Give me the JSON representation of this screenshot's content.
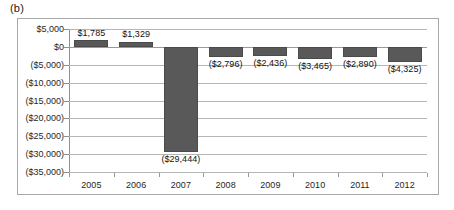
{
  "panel": {
    "label": "(b)"
  },
  "chart_data": {
    "type": "bar",
    "title": "",
    "subtitle": "",
    "xlabel": "",
    "ylabel": "",
    "categories": [
      "2005",
      "2006",
      "2007",
      "2008",
      "2009",
      "2010",
      "2011",
      "2012"
    ],
    "values": [
      1785,
      1329,
      -29444,
      -2796,
      -2436,
      -3465,
      -2890,
      -4325
    ],
    "data_labels": [
      "$1,785",
      "$1,329",
      "($29,444)",
      "($2,796)",
      "($2,436)",
      "($3,465)",
      "($2,890)",
      "($4,325)"
    ],
    "ylim": [
      -35000,
      5000
    ],
    "ytick_values": [
      5000,
      0,
      -5000,
      -10000,
      -15000,
      -20000,
      -25000,
      -30000,
      -35000
    ],
    "ytick_labels": [
      "$5,000",
      "$0",
      "($5,000)",
      "($10,000)",
      "($15,000)",
      "($20,000)",
      "($25,000)",
      "($30,000)",
      "($35,000)"
    ],
    "grid": true,
    "legend": "none",
    "legend_position": "none",
    "bar_color": "#595959",
    "gridline_color": "#b5b5b5",
    "axis_color": "#8f8f8f",
    "frame_color": "#a8a8a8",
    "background_color": "#ffffff",
    "series": [
      {
        "name": "Net amount",
        "values": [
          1785,
          1329,
          -29444,
          -2796,
          -2436,
          -3465,
          -2890,
          -4325
        ]
      }
    ]
  }
}
